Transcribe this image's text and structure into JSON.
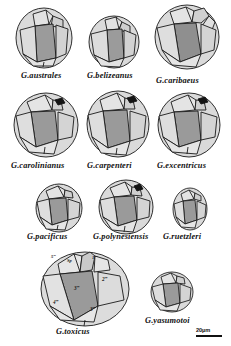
{
  "figure": {
    "type": "scientific-line-drawing-plate",
    "background": "#ffffff",
    "ink": "#1a1a1a",
    "fill_light": "#d9d9d9",
    "fill_mid": "#c2c2c2",
    "fill_dark": "#9b9b9b",
    "fill_darker": "#8a8a8a"
  },
  "specimens": [
    {
      "id": "australes",
      "label": "G.australes",
      "row": 1,
      "size": "medium"
    },
    {
      "id": "belizeanus",
      "label": "G.belizeanus",
      "row": 1,
      "size": "small"
    },
    {
      "id": "caribaeus",
      "label": "G.caribaeus",
      "row": 1,
      "size": "large"
    },
    {
      "id": "carolinianus",
      "label": "G.carolinianus",
      "row": 2,
      "size": "large"
    },
    {
      "id": "carpenteri",
      "label": "G.carpenteri",
      "row": 2,
      "size": "large"
    },
    {
      "id": "excentricus",
      "label": "G.excentricus",
      "row": 2,
      "size": "large"
    },
    {
      "id": "pacificus",
      "label": "G.pacificus",
      "row": 3,
      "size": "small"
    },
    {
      "id": "polynesiensis",
      "label": "G.polynesiensis",
      "row": 3,
      "size": "medium"
    },
    {
      "id": "ruetzleri",
      "label": "G.ruetzleri",
      "row": 3,
      "size": "xsmall"
    },
    {
      "id": "toxicus",
      "label": "G.toxicus",
      "row": 4,
      "size": "xlarge",
      "annotated": true
    },
    {
      "id": "yasumotoi",
      "label": "G.yasumotoi",
      "row": 4,
      "size": "small"
    }
  ],
  "plate_labels": {
    "five_triple_prime": "5‴",
    "sp": "Sp",
    "one_quad_prime": "1‴′",
    "two_triple_prime": "2‴",
    "three_triple_prime_center": "3‴",
    "three_triple_prime_lower": "3‴",
    "four_triple_prime": "4‴"
  },
  "scale": {
    "value": "20",
    "unit": "µm",
    "text": "20µm"
  }
}
